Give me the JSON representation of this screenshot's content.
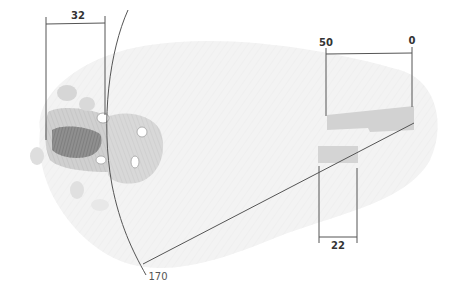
{
  "diagram": {
    "colors": {
      "background": "#ffffff",
      "sketch_light": "#e6e6e6",
      "sketch_mid": "#cfcfcf",
      "sketch_dark": "#9a9a9a",
      "band_gray": "#d2d2d2",
      "line": "#555555",
      "text": "#333333"
    },
    "dimensions": {
      "left_width": {
        "label": "32"
      },
      "right_top_left": {
        "label": "50"
      },
      "right_top_right": {
        "label": "0"
      },
      "lower_width": {
        "label": "22"
      },
      "arc_radius": {
        "label": "170"
      }
    }
  }
}
